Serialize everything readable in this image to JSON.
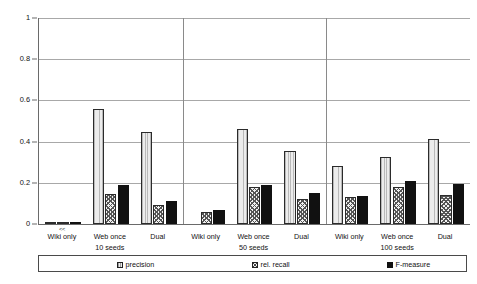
{
  "chart_data": {
    "type": "bar",
    "title": "",
    "xlabel": "",
    "ylabel": "",
    "ylim": [
      0,
      1
    ],
    "yticks": [
      "0",
      "0.2",
      "0.4",
      "0.6",
      "0.8",
      "1"
    ],
    "ytick_values": [
      0,
      0.2,
      0.4,
      0.6,
      0.8,
      1
    ],
    "grid": true,
    "legend_position": "bottom",
    "categories": [
      "Wiki only",
      "Web once",
      "Dual",
      "Wiki only",
      "Web once",
      "Dual",
      "Wiki only",
      "Web once",
      "Dual"
    ],
    "groups": [
      {
        "seeds_label": "10 seeds",
        "categories": [
          "Wiki only",
          "Web once",
          "Dual"
        ]
      },
      {
        "seeds_label": "50 seeds",
        "categories": [
          "Wiki only",
          "Web once",
          "Dual"
        ]
      },
      {
        "seeds_label": "100 seeds",
        "categories": [
          "Wiki only",
          "Web once",
          "Dual"
        ]
      }
    ],
    "series": [
      {
        "name": "precision",
        "values": [
          0.005,
          0.56,
          0.445,
          0.0,
          0.46,
          0.355,
          0.28,
          0.325,
          0.415
        ]
      },
      {
        "name": "rel. recall",
        "values": [
          0.002,
          0.145,
          0.09,
          0.06,
          0.18,
          0.12,
          0.13,
          0.18,
          0.14
        ]
      },
      {
        "name": "F-measure",
        "values": [
          0.008,
          0.19,
          0.11,
          0.07,
          0.188,
          0.152,
          0.135,
          0.21,
          0.195
        ]
      }
    ],
    "annotations": [
      {
        "text": "<<",
        "group": 0,
        "category": "Wiki only"
      }
    ]
  },
  "legend": {
    "items": [
      {
        "label": "precision",
        "marker": "precision-swatch-icon"
      },
      {
        "label": "rel. recall",
        "marker": "recall-swatch-icon"
      },
      {
        "label": "F-measure",
        "marker": "fmeasure-swatch-icon"
      }
    ]
  },
  "colors": {
    "precision": "#dcdcdc",
    "recall": "#f2f2f2",
    "fmeasure": "#111111",
    "axis": "#6a6a6a",
    "grid": "#a8a8a8",
    "background": "#ffffff"
  }
}
